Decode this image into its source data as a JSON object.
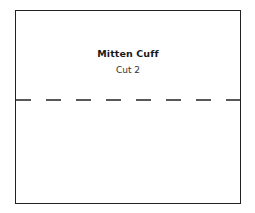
{
  "pattern_piece": {
    "title": "Mitten Cuff",
    "instruction": "Cut 2",
    "line_color": "#222222",
    "fold_line_style": "dashed"
  }
}
